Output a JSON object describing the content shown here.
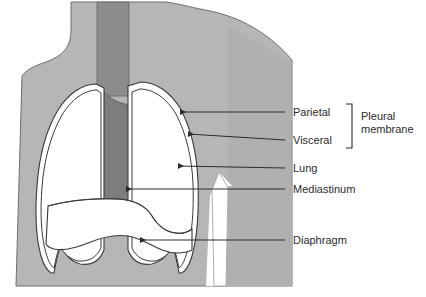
{
  "figure": {
    "colors": {
      "background": "#ffffff",
      "body_fill": "#b6b6b6",
      "body_fill_dark": "#a8a8a8",
      "trachea_fill": "#8c8c8c",
      "mediastinum_fill": "#7d7d7d",
      "lung_fill": "#ffffff",
      "outline": "#3a3a3a",
      "label_text": "#2b2b2b",
      "leader_line": "#2b2b2b"
    }
  },
  "labels": [
    {
      "id": "parietal",
      "text": "Parietal",
      "x": 293,
      "y": 116,
      "leader": {
        "x1": 285,
        "y1": 112,
        "x2": 178,
        "y2": 112
      },
      "arrow": true
    },
    {
      "id": "visceral",
      "text": "Visceral",
      "x": 293,
      "y": 144,
      "leader": {
        "x1": 285,
        "y1": 140,
        "x2": 186,
        "y2": 133
      },
      "arrow": true
    },
    {
      "id": "lung",
      "text": "Lung",
      "x": 293,
      "y": 172,
      "leader": {
        "x1": 285,
        "y1": 168,
        "x2": 175,
        "y2": 166
      },
      "arrow": true
    },
    {
      "id": "mediastinum",
      "text": "Mediastinum",
      "x": 293,
      "y": 193,
      "leader": {
        "x1": 285,
        "y1": 189,
        "x2": 123,
        "y2": 189
      },
      "arrow": true
    },
    {
      "id": "diaphragm",
      "text": "Diaphragm",
      "x": 293,
      "y": 244,
      "leader": {
        "x1": 285,
        "y1": 240,
        "x2": 137,
        "y2": 240
      },
      "arrow": true
    }
  ],
  "group_label": {
    "id": "pleural-membrane",
    "line1": "Pleural",
    "line2": "membrane",
    "x": 364,
    "y1": 120,
    "y2": 133,
    "bracket": {
      "x": 352,
      "top": 104,
      "bottom": 148,
      "tick": 6
    }
  }
}
